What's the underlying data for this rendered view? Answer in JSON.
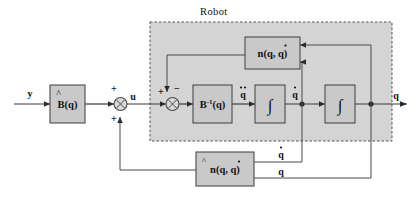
{
  "diagram": {
    "type": "control-block-diagram",
    "group_label": "Robot",
    "blocks": [
      {
        "id": "b-hat",
        "label": "B(q)",
        "label_plain": "B_hat(q)",
        "accent": "hat",
        "role": "feedforward-inertia-estimate"
      },
      {
        "id": "b-inv",
        "label": "B",
        "label_sup": "-1",
        "label_tail": "(q)",
        "label_plain": "B^-1(q)",
        "role": "inverse-inertia"
      },
      {
        "id": "n-true",
        "label": "n(q, q)",
        "label_plain": "n(q, q_dot)",
        "accent": "dot-second",
        "role": "nonlinear-terms"
      },
      {
        "id": "n-hat",
        "label": "n(q, q)",
        "label_plain": "n_hat(q, q_dot)",
        "accent": "hat-and-dot",
        "role": "nonlinear-terms-estimate"
      },
      {
        "id": "int-1",
        "label": "∫",
        "label_plain": "integral",
        "role": "integrator-1"
      },
      {
        "id": "int-2",
        "label": "∫",
        "label_plain": "integral",
        "role": "integrator-2"
      }
    ],
    "signals": {
      "input": "y",
      "control": "u",
      "accel": "q",
      "accel_plain": "q_ddot",
      "velocity": "q",
      "velocity_plain": "q_dot",
      "position": "q",
      "fb_velocity": "q",
      "fb_position": "q"
    },
    "sum_signs": {
      "sum1_top": "+",
      "sum1_bottom": "+",
      "sum2_left": "+",
      "sum2_top": "−"
    },
    "colors": {
      "block_fill": "#c9c9c9",
      "group_fill": "#d4d4d4",
      "wire": "#3a3a3a",
      "text": "#111111",
      "page_bg": "#ffffff"
    }
  }
}
